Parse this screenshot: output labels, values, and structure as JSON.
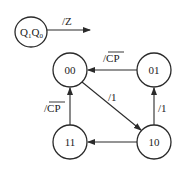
{
  "diagram": {
    "type": "state-transition",
    "legend": {
      "node_label_main": "Q",
      "node_sub1": "1",
      "node_sub2": "0",
      "node_text": "Q1Q0",
      "output_label": "/Z"
    },
    "nodes": [
      {
        "id": "00",
        "label": "00"
      },
      {
        "id": "01",
        "label": "01"
      },
      {
        "id": "10",
        "label": "10"
      },
      {
        "id": "11",
        "label": "11"
      }
    ],
    "edges": [
      {
        "from": "01",
        "to": "00",
        "label": "/CP",
        "overline": "CP",
        "prefix": "/"
      },
      {
        "from": "00",
        "to": "10",
        "label": "/1"
      },
      {
        "from": "10",
        "to": "01",
        "label": "/1"
      },
      {
        "from": "10",
        "to": "11",
        "label": ""
      },
      {
        "from": "11",
        "to": "00",
        "label": "/CP",
        "overline": "CP",
        "prefix": "/"
      }
    ]
  }
}
